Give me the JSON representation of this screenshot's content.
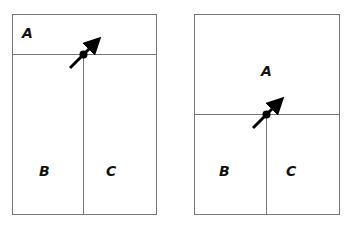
{
  "diagrams": [
    {
      "id": "left",
      "regions": [
        {
          "label": "A",
          "x": 28,
          "y": 37
        },
        {
          "label": "B",
          "x": 45,
          "y": 175
        },
        {
          "label": "C",
          "x": 112,
          "y": 175
        }
      ]
    },
    {
      "id": "right",
      "regions": [
        {
          "label": "A",
          "x": 267,
          "y": 75
        },
        {
          "label": "B",
          "x": 225,
          "y": 175
        },
        {
          "label": "C",
          "x": 292,
          "y": 175
        }
      ]
    }
  ],
  "colors": {
    "line": "#777777",
    "arrow": "#000000"
  }
}
